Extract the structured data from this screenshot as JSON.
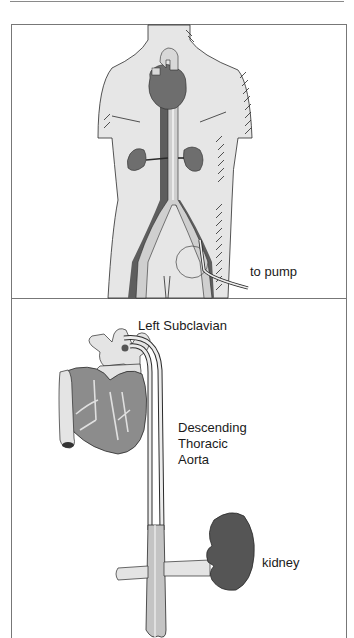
{
  "figure": {
    "panel_top": {
      "description": "Full torso view with heart, kidneys, aorta and femoral cannula",
      "labels": {
        "pump": "to pump"
      }
    },
    "panel_bottom": {
      "description": "Close-up of heart, aortic arch, descending aorta shunt and kidney",
      "labels": {
        "subclavian": "Left Subclavian",
        "aorta_line1": "Descending",
        "aorta_line2": "Thoracic",
        "aorta_line3": "Aorta",
        "kidney": "kidney"
      }
    },
    "colors": {
      "skin": "#e6e6e6",
      "organ_dark": "#6e6e6e",
      "organ_mid": "#8c8c8c",
      "vessel_light": "#d6d6d6",
      "line": "#2a2a2a",
      "frame": "#777777"
    }
  }
}
